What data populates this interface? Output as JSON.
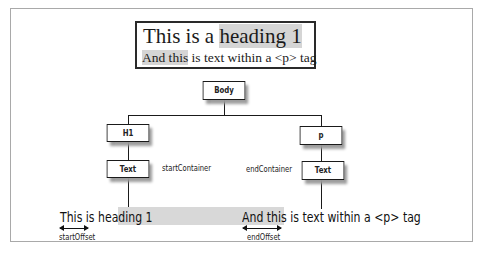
{
  "sample": {
    "h1_prefix": "This is a ",
    "h1_selected": "heading 1",
    "p_selected": "And this",
    "p_rest": " is text within a <p> tag"
  },
  "tree": {
    "nodes": {
      "body": "Body",
      "h1": "H1",
      "p": "p",
      "text_left": "Text",
      "text_right": "Text"
    },
    "labels": {
      "start_container": "startContainer",
      "end_container": "endContainer",
      "start_offset": "startOffset",
      "end_offset": "endOffset"
    }
  },
  "bottom": {
    "left_prefix": "This is ",
    "left_selected": "heading 1",
    "right_selected": "And this",
    "right_rest": " is text within a <p> tag"
  },
  "colors": {
    "selection": "#d5d5d5",
    "line": "#1a1a1a",
    "shadow": "#9a9a9a"
  }
}
